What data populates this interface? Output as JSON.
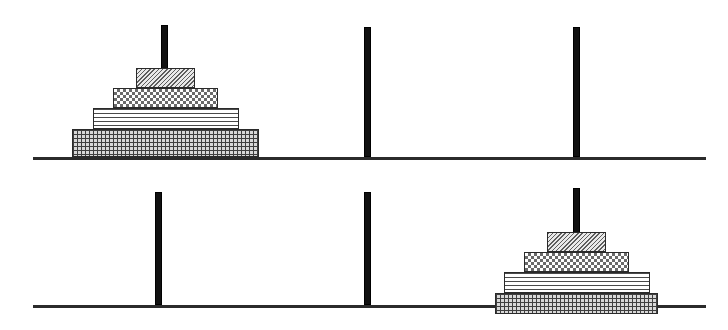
{
  "figure": {
    "kind": "towers-of-hanoi",
    "peg_count": 3,
    "disk_count": 4,
    "ink_color": "#111111",
    "baseline_color": "#2b2b2b",
    "disk_outline_color": "#2a2a2a"
  },
  "disk_styles": [
    {
      "id": "disk-1",
      "size_rank": 1,
      "pattern": "diagonal-hatch"
    },
    {
      "id": "disk-2",
      "size_rank": 2,
      "pattern": "checkerboard"
    },
    {
      "id": "disk-3",
      "size_rank": 3,
      "pattern": "horizontal-lines"
    },
    {
      "id": "disk-4",
      "size_rank": 4,
      "pattern": "fine-grid"
    }
  ],
  "panels": [
    {
      "id": "panel-top",
      "name": "initial-state",
      "baseline": {
        "x": 33,
        "y": 157,
        "width": 673,
        "height": 3
      },
      "pegs": [
        {
          "id": "peg-top-1",
          "index": 1,
          "x": 161,
          "y": 25,
          "width": 7,
          "height": 132,
          "occupied": true
        },
        {
          "id": "peg-top-2",
          "index": 2,
          "x": 364,
          "y": 27,
          "width": 7,
          "height": 130,
          "occupied": false
        },
        {
          "id": "peg-top-3",
          "index": 3,
          "x": 573,
          "y": 27,
          "width": 7,
          "height": 130,
          "occupied": false
        }
      ],
      "disks": [
        {
          "ref": "disk-1",
          "peg": 1,
          "level": 4,
          "x": 136,
          "y": 68,
          "width": 59,
          "height": 20
        },
        {
          "ref": "disk-2",
          "peg": 1,
          "level": 3,
          "x": 113,
          "y": 88,
          "width": 105,
          "height": 20
        },
        {
          "ref": "disk-3",
          "peg": 1,
          "level": 2,
          "x": 93,
          "y": 108,
          "width": 146,
          "height": 21
        },
        {
          "ref": "disk-4",
          "peg": 1,
          "level": 1,
          "x": 72,
          "y": 129,
          "width": 187,
          "height": 28
        }
      ]
    },
    {
      "id": "panel-bottom",
      "name": "final-state",
      "baseline": {
        "x": 33,
        "y": 305,
        "width": 673,
        "height": 3
      },
      "pegs": [
        {
          "id": "peg-bottom-1",
          "index": 1,
          "x": 155,
          "y": 192,
          "width": 7,
          "height": 113,
          "occupied": false
        },
        {
          "id": "peg-bottom-2",
          "index": 2,
          "x": 364,
          "y": 192,
          "width": 7,
          "height": 113,
          "occupied": false
        },
        {
          "id": "peg-bottom-3",
          "index": 3,
          "x": 573,
          "y": 188,
          "width": 7,
          "height": 117,
          "occupied": true
        }
      ],
      "disks": [
        {
          "ref": "disk-1",
          "peg": 3,
          "level": 4,
          "x": 547,
          "y": 232,
          "width": 59,
          "height": 20
        },
        {
          "ref": "disk-2",
          "peg": 3,
          "level": 3,
          "x": 524,
          "y": 252,
          "width": 105,
          "height": 20
        },
        {
          "ref": "disk-3",
          "peg": 3,
          "level": 2,
          "x": 504,
          "y": 272,
          "width": 146,
          "height": 21
        },
        {
          "ref": "disk-4",
          "peg": 3,
          "level": 1,
          "x": 495,
          "y": 293,
          "width": 163,
          "height": 21
        }
      ]
    }
  ]
}
